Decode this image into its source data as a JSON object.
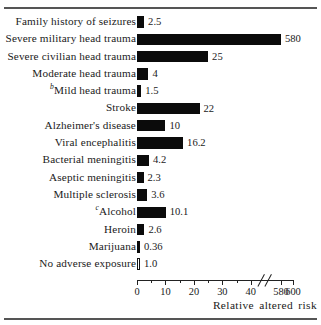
{
  "chart_data": {
    "type": "bar",
    "orientation": "horizontal",
    "title": "",
    "xlabel": "Relative  altered  risk",
    "ylabel": "",
    "grid": false,
    "legend": null,
    "axis_break": {
      "from": 45,
      "to": 570
    },
    "xticks": [
      {
        "value": 0,
        "label": "0",
        "major": true
      },
      {
        "value": 5,
        "label": "",
        "major": false
      },
      {
        "value": 10,
        "label": "10",
        "major": true
      },
      {
        "value": 15,
        "label": "",
        "major": false
      },
      {
        "value": 20,
        "label": "20",
        "major": true
      },
      {
        "value": 25,
        "label": "",
        "major": false
      },
      {
        "value": 30,
        "label": "30",
        "major": true
      },
      {
        "value": 35,
        "label": "",
        "major": false
      },
      {
        "value": 40,
        "label": "40",
        "major": true
      },
      {
        "value": 580,
        "label": "580",
        "major": true
      },
      {
        "value": 600,
        "label": "600",
        "major": true
      }
    ],
    "xlim": [
      0,
      600
    ],
    "categories": [
      "Family history of seizures",
      "Severe military head trauma",
      "Severe civilian head trauma",
      "Moderate head trauma",
      "Mild head trauma",
      "Stroke",
      "Alzheimer's disease",
      "Viral encephalitis",
      "Bacterial meningitis",
      "Aseptic meningitis",
      "Multiple sclerosis",
      "Alcohol",
      "Heroin",
      "Marijuana",
      "No adverse exposure"
    ],
    "values": [
      2.5,
      580,
      25,
      4,
      1.5,
      22,
      10,
      16.2,
      4.2,
      2.3,
      3.6,
      10.1,
      2.6,
      0.36,
      1.0
    ],
    "value_labels": [
      "2.5",
      "580",
      "25",
      "4",
      "1.5",
      "22",
      "10",
      "16.2",
      "4.2",
      "2.3",
      "3.6",
      "10.1",
      "2.6",
      "0.36",
      "1.0"
    ]
  },
  "rows": [
    {
      "sup": "",
      "label": "Family history of seizures",
      "value": 2.5,
      "value_label": "2.5",
      "style": "filled"
    },
    {
      "sup": "",
      "label": "Severe military head trauma",
      "value": 580,
      "value_label": "580",
      "style": "filled"
    },
    {
      "sup": "",
      "label": "Severe civilian head trauma",
      "value": 25,
      "value_label": "25",
      "style": "filled"
    },
    {
      "sup": "",
      "label": "Moderate head trauma",
      "value": 4,
      "value_label": "4",
      "style": "filled"
    },
    {
      "sup": "b",
      "label": "Mild head trauma",
      "value": 1.5,
      "value_label": "1.5",
      "style": "filled"
    },
    {
      "sup": "",
      "label": "Stroke",
      "value": 22,
      "value_label": "22",
      "style": "filled"
    },
    {
      "sup": "",
      "label": "Alzheimer's disease",
      "value": 10,
      "value_label": "10",
      "style": "filled"
    },
    {
      "sup": "",
      "label": "Viral encephalitis",
      "value": 16.2,
      "value_label": "16.2",
      "style": "filled"
    },
    {
      "sup": "",
      "label": "Bacterial meningitis",
      "value": 4.2,
      "value_label": "4.2",
      "style": "filled"
    },
    {
      "sup": "",
      "label": "Aseptic meningitis",
      "value": 2.3,
      "value_label": "2.3",
      "style": "filled"
    },
    {
      "sup": "",
      "label": "Multiple sclerosis",
      "value": 3.6,
      "value_label": "3.6",
      "style": "filled"
    },
    {
      "sup": "c",
      "label": "Alcohol",
      "value": 10.1,
      "value_label": "10.1",
      "style": "filled"
    },
    {
      "sup": "",
      "label": "Heroin",
      "value": 2.6,
      "value_label": "2.6",
      "style": "filled"
    },
    {
      "sup": "",
      "label": "Marijuana",
      "value": 0.36,
      "value_label": "0.36",
      "style": "filled"
    },
    {
      "sup": "",
      "label": "No adverse exposure",
      "value": 1.0,
      "value_label": "1.0",
      "style": "hollow"
    }
  ],
  "axis": {
    "title": "Relative  altered  risk"
  },
  "colors": {
    "bar": "#0b0b0b",
    "axis": "#222222",
    "rule": "#555555",
    "text": "#1a1a1a",
    "background": "#ffffff"
  }
}
